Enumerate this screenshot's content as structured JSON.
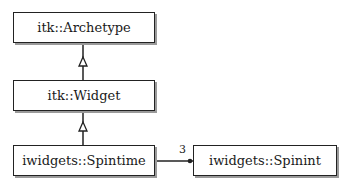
{
  "diagram": {
    "type": "UML class diagram",
    "classes": [
      {
        "id": "archetype",
        "label": "itk::Archetype"
      },
      {
        "id": "widget",
        "label": "itk::Widget"
      },
      {
        "id": "spintime",
        "label": "iwidgets::Spintime"
      },
      {
        "id": "spinint",
        "label": "iwidgets::Spinint"
      }
    ],
    "relations": [
      {
        "type": "inheritance",
        "from": "widget",
        "to": "archetype"
      },
      {
        "type": "inheritance",
        "from": "spintime",
        "to": "widget"
      },
      {
        "type": "association",
        "from": "spintime",
        "to": "spinint",
        "multiplicity": "3"
      }
    ]
  }
}
